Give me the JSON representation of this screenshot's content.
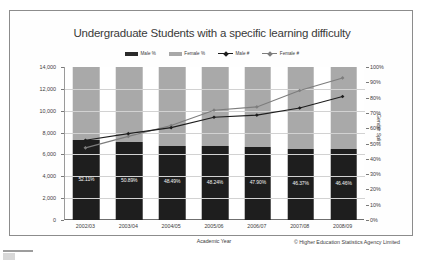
{
  "chart_data": {
    "type": "bar",
    "title": "Undergraduate Students with a specific learning difficulty",
    "xlabel": "Academic Year",
    "ylabel": "",
    "y2label": "Gender Split",
    "categories": [
      "2002/03",
      "2003/04",
      "2004/05",
      "2005/06",
      "2006/07",
      "2007/08",
      "2008/09"
    ],
    "ylim": [
      0,
      14000
    ],
    "y2lim": [
      0,
      100
    ],
    "yticks": [
      "0",
      "2,000",
      "4,000",
      "6,000",
      "8,000",
      "10,000",
      "12,000",
      "14,000"
    ],
    "y2ticks": [
      "0%",
      "10%",
      "20%",
      "30%",
      "40%",
      "50%",
      "60%",
      "70%",
      "80%",
      "90%",
      "100%"
    ],
    "grid": true,
    "legend_position": "top",
    "series": [
      {
        "name": "Male %",
        "type": "bar-stacked",
        "axis": "right",
        "color": "#1e1e1e",
        "values": [
          52.11,
          50.89,
          48.49,
          48.24,
          47.9,
          46.37,
          46.46
        ],
        "labels": [
          "52.11%",
          "50.89%",
          "48.49%",
          "48.24%",
          "47.90%",
          "46.37%",
          "46.46%"
        ]
      },
      {
        "name": "Female %",
        "type": "bar-stacked",
        "axis": "right",
        "color": "#a9a9a9",
        "values": [
          47.89,
          49.11,
          51.51,
          51.76,
          52.1,
          53.63,
          53.54
        ],
        "labels": []
      },
      {
        "name": "Male #",
        "type": "line",
        "axis": "left",
        "color": "#1d1d1d",
        "values": [
          7300,
          7900,
          8450,
          9400,
          9600,
          10250,
          11300
        ]
      },
      {
        "name": "Female #",
        "type": "line",
        "axis": "left",
        "color": "#7d7d7d",
        "values": [
          6600,
          7650,
          8650,
          10050,
          10350,
          11850,
          13000
        ]
      }
    ],
    "credit": "© Higher Education Statistics Agency Limited"
  },
  "legend": {
    "items": [
      {
        "label": "Male %",
        "marker": "swatch-dark"
      },
      {
        "label": "Female %",
        "marker": "swatch-grey"
      },
      {
        "label": "Male #",
        "marker": "line-dark"
      },
      {
        "label": "Female #",
        "marker": "line-grey"
      }
    ]
  }
}
